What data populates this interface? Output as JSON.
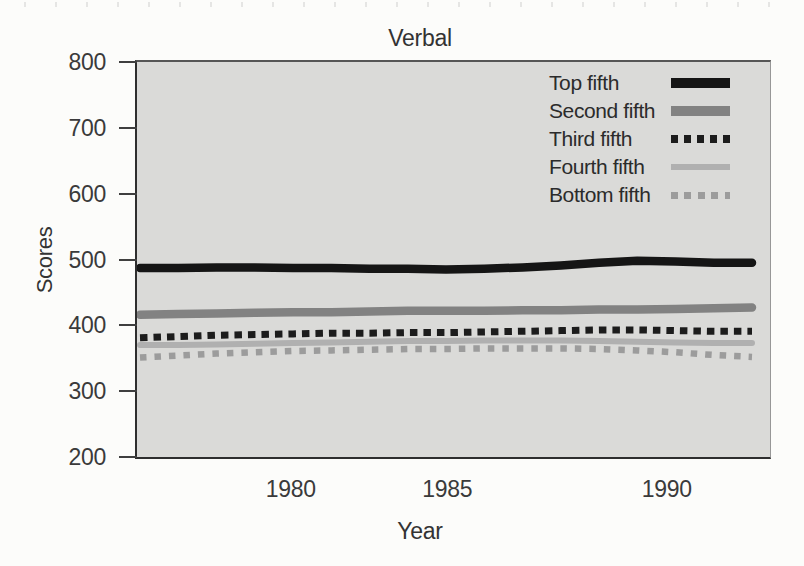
{
  "chart_data": {
    "type": "line",
    "title": "Verbal",
    "xlabel": "Year",
    "ylabel": "Scores",
    "x": [
      1976,
      1977,
      1978,
      1979,
      1980,
      1981,
      1982,
      1983,
      1984,
      1985,
      1986,
      1987,
      1988,
      1989,
      1990,
      1991,
      1992
    ],
    "xlim": [
      1976,
      1992
    ],
    "ylim": [
      200,
      800
    ],
    "xticks": [
      1980,
      1985,
      1990
    ],
    "yticks": [
      800,
      700,
      600,
      500,
      400,
      300,
      200
    ],
    "grid": false,
    "legend_position": "top-right-inside",
    "plot_background": "#dadad8",
    "series": [
      {
        "name": "Top fifth",
        "style": "solid-thick",
        "color": "#151515",
        "values": [
          487,
          487,
          488,
          488,
          487,
          487,
          486,
          486,
          485,
          486,
          488,
          491,
          495,
          498,
          497,
          495,
          495
        ]
      },
      {
        "name": "Second fifth",
        "style": "solid-thick",
        "color": "#828282",
        "values": [
          416,
          417,
          418,
          419,
          420,
          420,
          421,
          422,
          422,
          422,
          423,
          423,
          424,
          424,
          425,
          426,
          427
        ]
      },
      {
        "name": "Third fifth",
        "style": "dashed",
        "color": "#1c1c1c",
        "values": [
          381,
          383,
          385,
          386,
          387,
          388,
          388,
          389,
          389,
          390,
          391,
          392,
          393,
          393,
          392,
          391,
          391
        ]
      },
      {
        "name": "Fourth fifth",
        "style": "solid",
        "color": "#b0b0b0",
        "values": [
          370,
          370,
          371,
          372,
          373,
          374,
          375,
          376,
          376,
          377,
          377,
          377,
          376,
          375,
          374,
          373,
          373
        ]
      },
      {
        "name": "Bottom fifth",
        "style": "dotted",
        "color": "#9c9c9c",
        "values": [
          351,
          354,
          357,
          359,
          361,
          362,
          363,
          364,
          364,
          365,
          365,
          365,
          364,
          362,
          359,
          355,
          352
        ]
      }
    ]
  }
}
